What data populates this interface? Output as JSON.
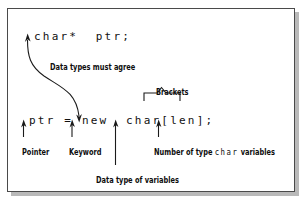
{
  "figure": {
    "frame_color": "#4a4a4a",
    "shadow_color": "#b9b9b9",
    "text_color": "#111111"
  },
  "code": {
    "declaration": "char*  ptr;",
    "allocation": "ptr = new  char[len];"
  },
  "annotations": {
    "agree": "Data types must agree",
    "brackets": "Brackets",
    "pointer": "Pointer",
    "keyword": "Keyword",
    "number_prefix": "Number of type",
    "number_mono": "char",
    "number_suffix": "variables",
    "datatype": "Data type of variables"
  }
}
